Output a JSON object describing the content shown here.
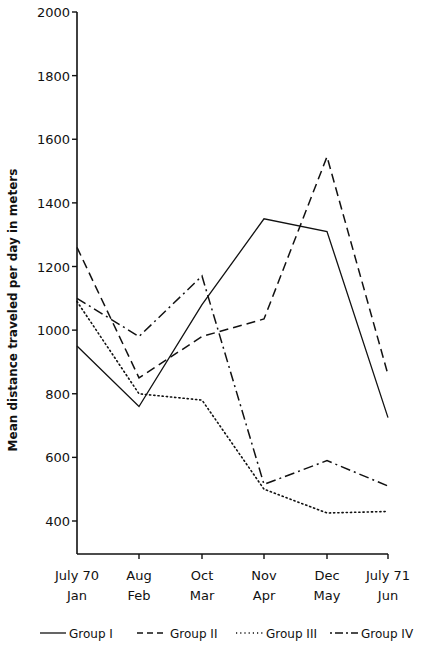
{
  "chart_data": {
    "type": "line",
    "title": "",
    "xlabel": "",
    "ylabel": "Mean distance traveled per day in meters",
    "ylim": [
      300,
      2000
    ],
    "yticks": [
      400,
      600,
      800,
      1000,
      1200,
      1400,
      1600,
      1800,
      2000
    ],
    "categories": [
      [
        "July 70",
        "Jan"
      ],
      [
        "Aug",
        "Feb"
      ],
      [
        "Oct",
        "Mar"
      ],
      [
        "Nov",
        "Apr"
      ],
      [
        "Dec",
        "May"
      ],
      [
        "July 71",
        "Jun"
      ]
    ],
    "grid": false,
    "legend_position": "bottom",
    "series": [
      {
        "name": "Group I",
        "style": "solid",
        "values": [
          950,
          760,
          1080,
          1350,
          1310,
          725
        ]
      },
      {
        "name": "Group II",
        "style": "dashed",
        "values": [
          1260,
          850,
          980,
          1035,
          1545,
          860
        ]
      },
      {
        "name": "Group III",
        "style": "dotted",
        "values": [
          1090,
          800,
          780,
          500,
          425,
          430
        ]
      },
      {
        "name": "Group IV",
        "style": "dash-dot",
        "values": [
          1100,
          980,
          1170,
          515,
          590,
          510
        ]
      }
    ]
  }
}
